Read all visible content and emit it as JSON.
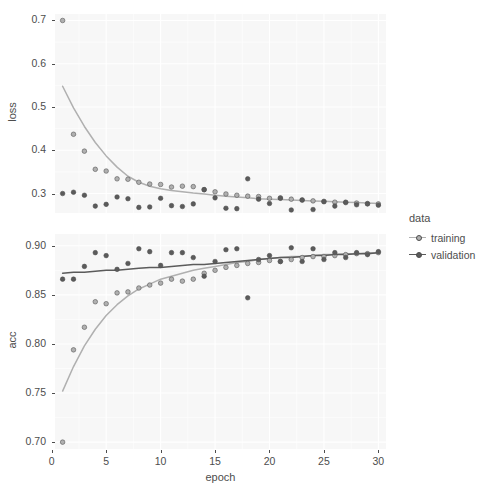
{
  "chart_data": {
    "type": "scatter",
    "title": "",
    "xlabel": "epoch",
    "xlim": [
      0.3,
      30.7
    ],
    "xticks": [
      0,
      5,
      10,
      15,
      20,
      25,
      30
    ],
    "grid": true,
    "legend": {
      "title": "data",
      "position": "right",
      "entries": [
        {
          "name": "training",
          "color": "#b0b0b0"
        },
        {
          "name": "validation",
          "color": "#5b5b5b"
        }
      ]
    },
    "panels": [
      {
        "ylabel": "loss",
        "ylim": [
          0.255,
          0.715
        ],
        "yticks": [
          0.3,
          0.4,
          0.5,
          0.6,
          0.7
        ],
        "ytick_labels": [
          "0.3",
          "0.4",
          "0.5",
          "0.6",
          "0.7"
        ],
        "series": [
          {
            "name": "training",
            "color": "#b0b0b0",
            "x": [
              1,
              2,
              3,
              4,
              5,
              6,
              7,
              8,
              9,
              10,
              11,
              12,
              13,
              14,
              15,
              16,
              17,
              18,
              19,
              20,
              21,
              22,
              23,
              24,
              25,
              26,
              27,
              28,
              29,
              30
            ],
            "y": [
              0.7,
              0.437,
              0.398,
              0.356,
              0.352,
              0.334,
              0.333,
              0.326,
              0.322,
              0.321,
              0.315,
              0.317,
              0.316,
              0.309,
              0.304,
              0.299,
              0.296,
              0.294,
              0.293,
              0.289,
              0.29,
              0.287,
              0.285,
              0.283,
              0.282,
              0.28,
              0.279,
              0.278,
              0.277,
              0.276
            ],
            "smooth": [
              0.548,
              0.498,
              0.455,
              0.418,
              0.387,
              0.361,
              0.34,
              0.326,
              0.317,
              0.311,
              0.307,
              0.304,
              0.301,
              0.299,
              0.296,
              0.294,
              0.292,
              0.29,
              0.288,
              0.287,
              0.286,
              0.285,
              0.284,
              0.283,
              0.282,
              0.281,
              0.28,
              0.279,
              0.278,
              0.277
            ]
          },
          {
            "name": "validation",
            "color": "#5b5b5b",
            "x": [
              1,
              2,
              3,
              4,
              5,
              6,
              7,
              8,
              9,
              10,
              11,
              12,
              13,
              14,
              15,
              16,
              17,
              18,
              19,
              20,
              21,
              22,
              23,
              24,
              25,
              26,
              27,
              28,
              29,
              30
            ],
            "y": [
              0.3,
              0.303,
              0.296,
              0.271,
              0.275,
              0.292,
              0.288,
              0.268,
              0.269,
              0.289,
              0.272,
              0.27,
              0.276,
              0.309,
              0.29,
              0.266,
              0.265,
              0.334,
              0.287,
              0.277,
              0.289,
              0.262,
              0.285,
              0.263,
              0.281,
              0.271,
              0.28,
              0.274,
              0.276,
              0.273
            ]
          }
        ]
      },
      {
        "ylabel": "acc",
        "ylim": [
          0.693,
          0.912
        ],
        "yticks": [
          0.7,
          0.75,
          0.8,
          0.85,
          0.9
        ],
        "ytick_labels": [
          "0.70",
          "0.75",
          "0.80",
          "0.85",
          "0.90"
        ],
        "series": [
          {
            "name": "training",
            "color": "#b0b0b0",
            "x": [
              1,
              2,
              3,
              4,
              5,
              6,
              7,
              8,
              9,
              10,
              11,
              12,
              13,
              14,
              15,
              16,
              17,
              18,
              19,
              20,
              21,
              22,
              23,
              24,
              25,
              26,
              27,
              28,
              29,
              30
            ],
            "y": [
              0.7,
              0.794,
              0.817,
              0.843,
              0.841,
              0.852,
              0.853,
              0.857,
              0.86,
              0.862,
              0.866,
              0.864,
              0.866,
              0.872,
              0.875,
              0.878,
              0.88,
              0.882,
              0.883,
              0.885,
              0.884,
              0.886,
              0.888,
              0.889,
              0.889,
              0.89,
              0.891,
              0.892,
              0.892,
              0.893
            ],
            "smooth": [
              0.752,
              0.777,
              0.798,
              0.815,
              0.829,
              0.84,
              0.849,
              0.856,
              0.861,
              0.866,
              0.869,
              0.872,
              0.875,
              0.877,
              0.879,
              0.881,
              0.883,
              0.884,
              0.886,
              0.887,
              0.888,
              0.889,
              0.889,
              0.89,
              0.891,
              0.891,
              0.892,
              0.892,
              0.893,
              0.893
            ]
          },
          {
            "name": "validation",
            "color": "#5b5b5b",
            "x": [
              1,
              2,
              3,
              4,
              5,
              6,
              7,
              8,
              9,
              10,
              11,
              12,
              13,
              14,
              15,
              16,
              17,
              18,
              19,
              20,
              21,
              22,
              23,
              24,
              25,
              26,
              27,
              28,
              29,
              30
            ],
            "y": [
              0.866,
              0.866,
              0.879,
              0.893,
              0.89,
              0.876,
              0.882,
              0.897,
              0.894,
              0.88,
              0.893,
              0.893,
              0.888,
              0.869,
              0.884,
              0.896,
              0.897,
              0.847,
              0.886,
              0.89,
              0.884,
              0.898,
              0.884,
              0.897,
              0.886,
              0.893,
              0.888,
              0.893,
              0.891,
              0.894
            ],
            "smooth": [
              0.872,
              0.873,
              0.873,
              0.874,
              0.875,
              0.875,
              0.876,
              0.877,
              0.878,
              0.878,
              0.879,
              0.88,
              0.881,
              0.881,
              0.882,
              0.883,
              0.884,
              0.885,
              0.886,
              0.887,
              0.888,
              0.888,
              0.889,
              0.89,
              0.89,
              0.891,
              0.891,
              0.892,
              0.892,
              0.893
            ]
          }
        ]
      }
    ]
  }
}
